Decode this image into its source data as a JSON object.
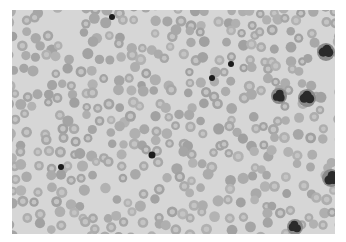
{
  "image": {
    "subject": "Blood smear micrograph (grayscale)",
    "area": {
      "x": 12,
      "y": 10,
      "width": 323,
      "height": 224
    },
    "colors": {
      "frame": "#ffffff",
      "background": "#d6d6d6",
      "rbc_rim": "#a8a8a8",
      "rbc_center": "#c4c4c4",
      "dark_cell": "#1c1c1c"
    },
    "dark_dots": [
      {
        "x": 112,
        "y": 17,
        "r": 3
      },
      {
        "x": 231,
        "y": 64,
        "r": 3
      },
      {
        "x": 212,
        "y": 78,
        "r": 3
      },
      {
        "x": 152,
        "y": 155,
        "r": 3.5
      },
      {
        "x": 61,
        "y": 167,
        "r": 3
      }
    ],
    "leukocytes": [
      {
        "x": 326,
        "y": 52,
        "r": 7
      },
      {
        "x": 279,
        "y": 96,
        "r": 6
      },
      {
        "x": 307,
        "y": 98,
        "r": 7
      },
      {
        "x": 331,
        "y": 178,
        "r": 7
      },
      {
        "x": 295,
        "y": 227,
        "r": 6
      }
    ]
  }
}
